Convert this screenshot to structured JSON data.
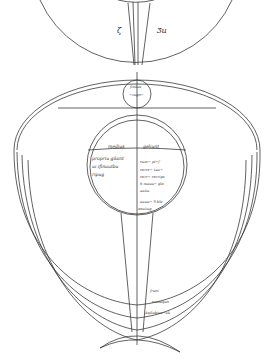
{
  "diagram": {
    "top_sphere": {
      "left_letter": "ζ",
      "right_letter": "Ʒu"
    },
    "small_circle": {
      "top_word": "finitus",
      "bottom_word": "~vugo~"
    },
    "inner_circle": {
      "left_heading": "medius",
      "right_heading": "geliunt",
      "left_lines": [
        "propriu gilant",
        "ui ifinuutbu",
        "ripug"
      ],
      "right_lines": [
        "cum~ pi~f",
        "cerre~ tuu~",
        "cerr~ cerrigs",
        "h nuiuu~ gla",
        "uuiiu",
        "uuuu~ 9 bla"
      ],
      "bottom_word": "aeuiiug"
    },
    "band_labels": [
      "fruoi",
      "cuuiuquo",
      "Aqilubiuu~uk"
    ]
  }
}
